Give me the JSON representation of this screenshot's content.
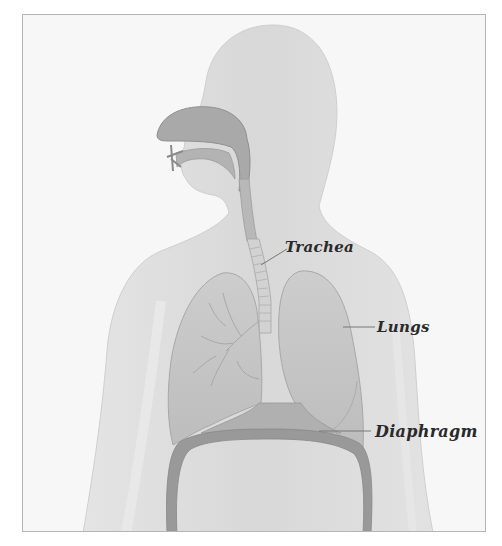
{
  "diagram": {
    "labels": [
      {
        "id": "trachea",
        "text": "Trachea"
      },
      {
        "id": "lungs",
        "text": "Lungs"
      },
      {
        "id": "diaphragm",
        "text": "Diaphragm"
      }
    ],
    "colors": {
      "background": "#f7f7f7",
      "body_silhouette": "#dcdcdc",
      "organ_fill": "#c4c4c4",
      "organ_dark": "#9a9a9a",
      "airway": "#a8a8a8",
      "leader_line": "#777777",
      "label_text": "#2a2a2a",
      "frame_border": "#b5b5b5"
    }
  }
}
